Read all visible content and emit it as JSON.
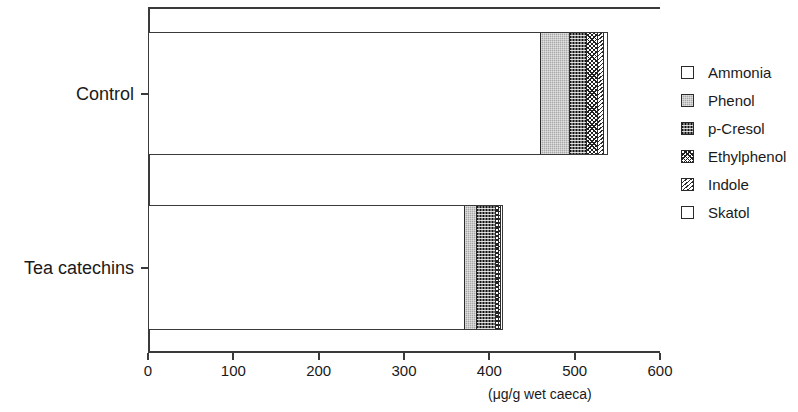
{
  "chart_data": {
    "type": "bar",
    "orientation": "horizontal",
    "stacked": true,
    "title": "",
    "xlabel": "(μg/g wet caeca)",
    "ylabel": "",
    "xlim": [
      0,
      600
    ],
    "xticks": [
      0,
      100,
      200,
      300,
      400,
      500,
      600
    ],
    "xtick_labels": [
      "0",
      "100",
      "200",
      "300",
      "400",
      "500",
      "600"
    ],
    "categories": [
      "Control",
      "Tea catechins"
    ],
    "grid": false,
    "legend_position": "right",
    "series": [
      {
        "name": "Ammonia",
        "values": [
          461,
          372
        ]
      },
      {
        "name": "Phenol",
        "values": [
          35,
          15
        ]
      },
      {
        "name": "p-Cresol",
        "values": [
          20,
          22
        ]
      },
      {
        "name": "Ethylphenol",
        "values": [
          12,
          4
        ]
      },
      {
        "name": "Indole",
        "values": [
          7,
          2
        ]
      },
      {
        "name": "Skatol",
        "values": [
          4,
          1
        ]
      }
    ],
    "totals": [
      539,
      416
    ]
  },
  "legend": {
    "items": [
      {
        "label": "Ammonia",
        "pattern": "solid-white"
      },
      {
        "label": "Phenol",
        "pattern": "gray-stipple"
      },
      {
        "label": "p-Cresol",
        "pattern": "dark-checker"
      },
      {
        "label": "Ethylphenol",
        "pattern": "crosshatch"
      },
      {
        "label": "Indole",
        "pattern": "diagonal-hatch"
      },
      {
        "label": "Skatol",
        "pattern": "solid-white"
      }
    ]
  },
  "axis": {
    "unit_label": "(μg/g wet caeca)",
    "x_tick_labels": [
      "0",
      "100",
      "200",
      "300",
      "400",
      "500",
      "600"
    ],
    "category_labels": [
      "Control",
      "Tea catechins"
    ]
  }
}
